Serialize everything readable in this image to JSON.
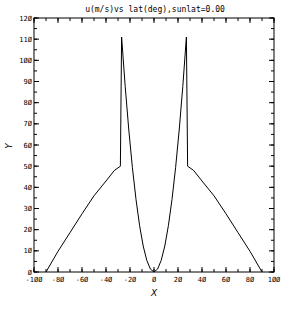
{
  "chart_data": {
    "type": "line",
    "title": "u(m/s)vs lat(deg),sunlat=0.00",
    "xlabel": "X",
    "ylabel": "Y",
    "xlim": [
      -100,
      100
    ],
    "ylim": [
      0,
      120
    ],
    "xticks": [
      -100,
      -80,
      -60,
      -40,
      -20,
      0,
      20,
      40,
      60,
      80,
      100
    ],
    "yticks": [
      0,
      10,
      20,
      30,
      40,
      50,
      60,
      70,
      80,
      90,
      100,
      110,
      120
    ],
    "x_minor_step": 10,
    "y_minor_step": 5,
    "grid": false,
    "legend": null,
    "series": [
      {
        "name": "u",
        "color": "#000000",
        "points": [
          [
            -90,
            0
          ],
          [
            -80,
            9.8
          ],
          [
            -70,
            18.6
          ],
          [
            -60,
            27.5
          ],
          [
            -50,
            36
          ],
          [
            -40,
            43
          ],
          [
            -33,
            48
          ],
          [
            -28,
            50
          ],
          [
            -28,
            51
          ],
          [
            -27,
            111
          ],
          [
            -24,
            87.7
          ],
          [
            -21,
            67.1
          ],
          [
            -18,
            49.3
          ],
          [
            -15,
            34.3
          ],
          [
            -12,
            21.9
          ],
          [
            -9,
            12.3
          ],
          [
            -6,
            5.5
          ],
          [
            -3,
            1.4
          ],
          [
            0,
            0
          ],
          [
            3,
            1.4
          ],
          [
            6,
            5.5
          ],
          [
            9,
            12.3
          ],
          [
            12,
            21.9
          ],
          [
            15,
            34.3
          ],
          [
            18,
            49.3
          ],
          [
            21,
            67.1
          ],
          [
            24,
            87.7
          ],
          [
            27,
            111
          ],
          [
            28,
            51
          ],
          [
            28,
            50
          ],
          [
            33,
            48
          ],
          [
            40,
            43
          ],
          [
            50,
            36
          ],
          [
            60,
            27.5
          ],
          [
            70,
            18.6
          ],
          [
            80,
            9.8
          ],
          [
            90,
            0
          ]
        ]
      }
    ]
  }
}
